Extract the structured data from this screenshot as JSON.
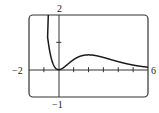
{
  "chart_data": {
    "type": "line",
    "title": "",
    "function": "f(x) = x^2 e^(-x)",
    "xlabel": "",
    "ylabel": "",
    "xlim": [
      -2,
      6
    ],
    "ylim": [
      -1,
      2
    ],
    "x_ticks_step": 1,
    "y_ticks_step": 1,
    "grid": false,
    "legend": null,
    "tick_labels": {
      "x_min": "−2",
      "x_max": "6",
      "y_max": "2",
      "y_min": "−1"
    },
    "series": [
      {
        "name": "f(x)",
        "x": [
          -0.7,
          -0.5,
          -0.25,
          0,
          0.5,
          1,
          1.5,
          2,
          2.5,
          3,
          3.5,
          4,
          4.5,
          5,
          5.5,
          6
        ],
        "values": [
          0.99,
          0.41,
          0.08,
          0,
          0.15,
          0.37,
          0.5,
          0.54,
          0.51,
          0.45,
          0.37,
          0.29,
          0.22,
          0.17,
          0.12,
          0.09
        ]
      }
    ],
    "colors": {
      "curve": "#1a1a1a",
      "axes": "#333333",
      "frame": "#333333"
    }
  }
}
